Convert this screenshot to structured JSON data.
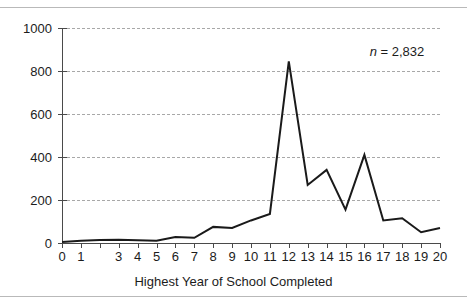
{
  "figure": {
    "annotation_symbol": "n",
    "annotation_value": "= 2,832"
  },
  "chart_data": {
    "type": "line",
    "title": "",
    "subtitle": "",
    "xlabel": "Highest Year of School Completed",
    "ylabel": "",
    "annotations": [
      "n = 2,832"
    ],
    "sample_size": 2832,
    "grid": true,
    "grid_style": "dashed horizontal",
    "legend": "none",
    "xlim": [
      0,
      20
    ],
    "ylim": [
      0,
      1000
    ],
    "ytick_labels": [
      "1000",
      "800",
      "600",
      "400",
      "200",
      "0"
    ],
    "ytick_values": [
      1000,
      800,
      600,
      400,
      200,
      0
    ],
    "xtick_values": [
      0,
      1,
      2,
      3,
      4,
      5,
      6,
      7,
      8,
      9,
      10,
      11,
      12,
      13,
      14,
      15,
      16,
      17,
      18,
      19,
      20
    ],
    "xtick_labels": [
      "0",
      "1",
      "",
      "3",
      "4",
      "5",
      "6",
      "7",
      "8",
      "9",
      "10",
      "11",
      "12",
      "13",
      "14",
      "15",
      "16",
      "17",
      "18",
      "19",
      "20"
    ],
    "x": [
      0,
      1,
      2,
      3,
      4,
      5,
      6,
      7,
      8,
      9,
      10,
      11,
      12,
      13,
      14,
      15,
      16,
      17,
      18,
      19,
      20
    ],
    "values": [
      5,
      10,
      14,
      15,
      13,
      10,
      28,
      24,
      75,
      70,
      105,
      135,
      845,
      270,
      340,
      155,
      410,
      105,
      115,
      50,
      70
    ],
    "series": [
      {
        "name": "Respondents",
        "values": [
          5,
          10,
          14,
          15,
          13,
          10,
          28,
          24,
          75,
          70,
          105,
          135,
          845,
          270,
          340,
          155,
          410,
          105,
          115,
          50,
          70
        ],
        "color": "#1a1a1a"
      }
    ]
  }
}
